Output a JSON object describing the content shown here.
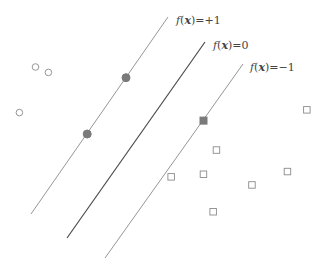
{
  "diagram": {
    "colors": {
      "margin_line": "#8a8a8a",
      "decision_line": "#4a4a4a",
      "hollow_marker": "#8a8a8a",
      "support_vector": "#7a7a7a",
      "label_text": "#444444"
    },
    "lines": [
      {
        "id": "positive-margin",
        "label_f": "f",
        "label_x": "x",
        "label_value": "=+1",
        "offset": 1
      },
      {
        "id": "decision-boundary",
        "label_f": "f",
        "label_x": "x",
        "label_value": "=0",
        "offset": 0
      },
      {
        "id": "negative-margin",
        "label_f": "f",
        "label_x": "x",
        "label_value": "=−1",
        "offset": -1
      }
    ],
    "positive_class": {
      "marker": "circle",
      "points": [
        {
          "u": 0.11,
          "v": 0.75,
          "support_vector": false
        },
        {
          "u": 0.15,
          "v": 0.73,
          "support_vector": false
        },
        {
          "u": 0.06,
          "v": 0.58,
          "support_vector": false
        },
        {
          "u": 0.39,
          "v": 0.71,
          "support_vector": true
        },
        {
          "u": 0.27,
          "v": 0.5,
          "support_vector": true
        }
      ]
    },
    "negative_class": {
      "marker": "square",
      "points": [
        {
          "u": 0.63,
          "v": 0.55,
          "support_vector": true
        },
        {
          "u": 0.95,
          "v": 0.59,
          "support_vector": false
        },
        {
          "u": 0.67,
          "v": 0.44,
          "support_vector": false
        },
        {
          "u": 0.63,
          "v": 0.35,
          "support_vector": false
        },
        {
          "u": 0.53,
          "v": 0.34,
          "support_vector": false
        },
        {
          "u": 0.78,
          "v": 0.31,
          "support_vector": false
        },
        {
          "u": 0.89,
          "v": 0.36,
          "support_vector": false
        },
        {
          "u": 0.66,
          "v": 0.21,
          "support_vector": false
        }
      ]
    }
  }
}
